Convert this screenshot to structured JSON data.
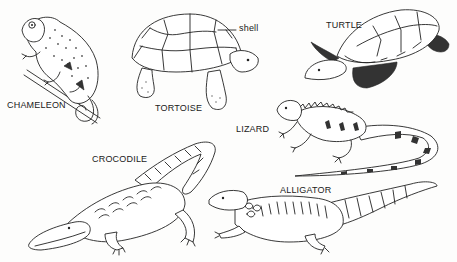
{
  "figure": {
    "labels": {
      "chameleon": "CHAMELEON",
      "tortoise": "TORTOISE",
      "shell": "shell",
      "turtle": "TURTLE",
      "lizard": "LIZARD",
      "crocodile": "CROCODILE",
      "alligator": "ALLIGATOR"
    },
    "colors": {
      "ink": "#222222",
      "paper": "#fdfdfc"
    }
  }
}
